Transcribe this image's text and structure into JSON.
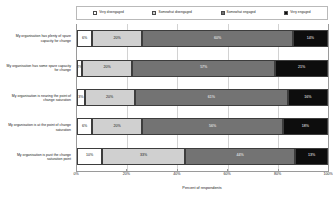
{
  "chart_data": {
    "type": "bar",
    "orientation": "horizontal",
    "stacked": true,
    "stack_mode": "percent",
    "title": "",
    "xlabel": "Percent of respondents",
    "ylabel": "",
    "xlim": [
      0,
      100
    ],
    "xticks": [
      0,
      20,
      40,
      60,
      80,
      100
    ],
    "xtick_labels": [
      "0%",
      "20%",
      "40%",
      "60%",
      "80%",
      "100%"
    ],
    "grid": true,
    "legend_position": "top",
    "categories": [
      "My organisation has plenty of spare capacity for change",
      "My organisation has some spare capacity for change",
      "My organisation is nearing the point of change saturation",
      "My organisation is at the point of change saturation",
      "My organisation is past the change saturation point"
    ],
    "series": [
      {
        "name": "Very disengaged",
        "color": "#ffffff",
        "values": [
          6,
          2,
          3,
          6,
          10
        ],
        "labels": [
          "6%",
          "2%",
          "3%",
          "6%",
          "10%"
        ]
      },
      {
        "name": "Somewhat disengaged",
        "color": "#d0d0d0",
        "values": [
          20,
          20,
          20,
          20,
          33
        ],
        "labels": [
          "20%",
          "20%",
          "20%",
          "20%",
          "33%"
        ]
      },
      {
        "name": "Somewhat engaged",
        "color": "#737373",
        "values": [
          60,
          57,
          61,
          56,
          44
        ],
        "labels": [
          "60%",
          "57%",
          "61%",
          "56%",
          "44%"
        ]
      },
      {
        "name": "Very engaged",
        "color": "#0d0d0d",
        "values": [
          14,
          21,
          16,
          18,
          13
        ],
        "labels": [
          "14%",
          "21%",
          "16%",
          "18%",
          "13%"
        ]
      }
    ]
  }
}
